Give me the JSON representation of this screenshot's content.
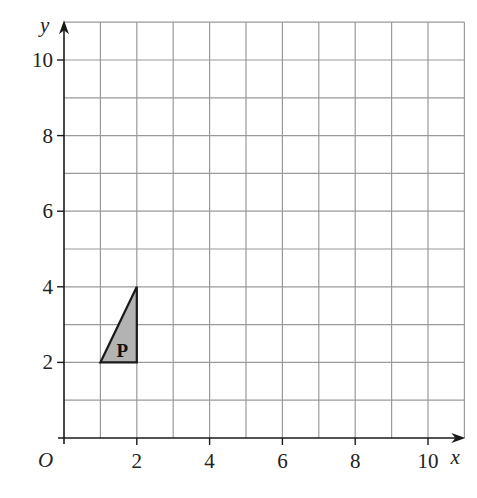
{
  "diagram": {
    "type": "coordinate-grid",
    "axes": {
      "x_label": "x",
      "y_label": "y",
      "origin_label": "O",
      "x_range": [
        0,
        11
      ],
      "y_range": [
        0,
        11
      ],
      "x_ticks": [
        {
          "v": 2,
          "label": "2"
        },
        {
          "v": 4,
          "label": "4"
        },
        {
          "v": 6,
          "label": "6"
        },
        {
          "v": 8,
          "label": "8"
        },
        {
          "v": 10,
          "label": "10"
        }
      ],
      "y_ticks": [
        {
          "v": 2,
          "label": "2"
        },
        {
          "v": 4,
          "label": "4"
        },
        {
          "v": 6,
          "label": "6"
        },
        {
          "v": 8,
          "label": "8"
        },
        {
          "v": 10,
          "label": "10"
        }
      ],
      "grid": true,
      "grid_step": 1
    },
    "shapes": [
      {
        "name": "P",
        "label": "P",
        "vertices": [
          [
            1,
            2
          ],
          [
            2,
            2
          ],
          [
            2,
            4
          ]
        ],
        "fill": "#b3b3b3",
        "stroke": "#1a1a1a"
      }
    ],
    "colors": {
      "grid": "#9a9a9a",
      "axis": "#1a1a1a",
      "shape_fill": "#b3b3b3"
    }
  }
}
